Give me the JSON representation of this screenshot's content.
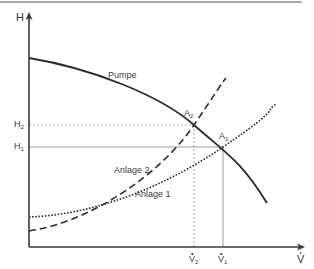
{
  "diagram": {
    "type": "pump-system-characteristic",
    "axes": {
      "y_label": "H",
      "x_label": "V",
      "x_label_accent": "dot"
    },
    "curves": [
      {
        "id": "pump",
        "label": "Pumpe",
        "style": "solid"
      },
      {
        "id": "system2",
        "label": "Anlage 2",
        "style": "dashed"
      },
      {
        "id": "system1",
        "label": "Anlage 1",
        "style": "dotted"
      }
    ],
    "operating_points": [
      {
        "id": "A1",
        "label": "A",
        "sub": "1",
        "h_label": "H",
        "h_sub": "1",
        "v_label": "V",
        "v_sub": "1",
        "guide_style": "solid"
      },
      {
        "id": "A2",
        "label": "A",
        "sub": "2",
        "h_label": "H",
        "h_sub": "2",
        "v_label": "V",
        "v_sub": "2",
        "guide_style": "dotted"
      }
    ],
    "colors": {
      "curve": "#2b2b2b",
      "axis": "#3a3a3a",
      "guide": "#9a9a9a",
      "top_rule": "#8c8c8c",
      "text": "#3a3a3a"
    }
  }
}
